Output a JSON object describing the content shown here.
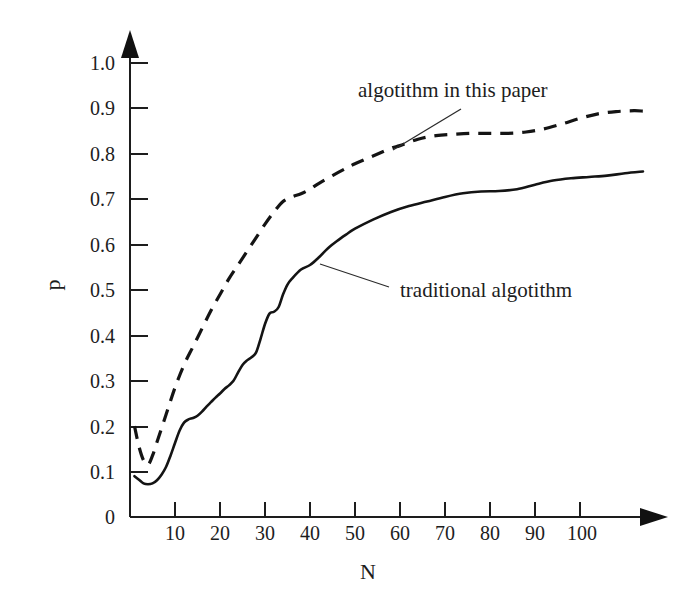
{
  "chart_data": {
    "type": "line",
    "title": "",
    "xlabel": "N",
    "ylabel": "p",
    "xlim": [
      0,
      120
    ],
    "ylim": [
      0,
      1.0
    ],
    "grid": false,
    "legend_position": "inline-annotations",
    "x_ticks": [
      "10",
      "20",
      "30",
      "40",
      "50",
      "60",
      "70",
      "80",
      "90",
      "100"
    ],
    "x_tick_values": [
      10,
      20,
      30,
      40,
      50,
      60,
      70,
      80,
      90,
      100
    ],
    "y_ticks": [
      "0",
      "0.1",
      "0.2",
      "0.3",
      "0.4",
      "0.5",
      "0.6",
      "0.7",
      "0.8",
      "0.9",
      "1.0"
    ],
    "y_tick_values": [
      0,
      0.1,
      0.2,
      0.3,
      0.4,
      0.5,
      0.6,
      0.7,
      0.8,
      0.9,
      1.0
    ],
    "series": [
      {
        "name": "algotithm in this paper",
        "style": "dashed",
        "x": [
          1,
          2,
          3,
          4,
          5,
          6,
          8,
          10,
          12,
          14,
          16,
          18,
          20,
          22,
          24,
          26,
          28,
          30,
          32,
          34,
          36,
          38,
          40,
          42,
          45,
          48,
          50,
          54,
          58,
          60,
          64,
          68,
          72,
          76,
          80,
          84,
          88,
          92,
          96,
          100,
          104,
          108,
          112,
          114
        ],
        "values": [
          0.2,
          0.155,
          0.125,
          0.115,
          0.135,
          0.165,
          0.225,
          0.285,
          0.335,
          0.375,
          0.415,
          0.455,
          0.49,
          0.525,
          0.555,
          0.585,
          0.615,
          0.645,
          0.672,
          0.695,
          0.705,
          0.712,
          0.722,
          0.735,
          0.752,
          0.768,
          0.778,
          0.795,
          0.812,
          0.818,
          0.832,
          0.84,
          0.843,
          0.845,
          0.845,
          0.845,
          0.848,
          0.855,
          0.866,
          0.878,
          0.888,
          0.893,
          0.895,
          0.894
        ]
      },
      {
        "name": "traditional algotithm",
        "style": "solid",
        "x": [
          1,
          2,
          3,
          4,
          5,
          6,
          7,
          8,
          9,
          10,
          11,
          12,
          13,
          14,
          15,
          16,
          17,
          18,
          19,
          20,
          21,
          22,
          23,
          24,
          25,
          26,
          27,
          28,
          29,
          30,
          31,
          32,
          33,
          34,
          35,
          36,
          38,
          40,
          42,
          44,
          46,
          48,
          50,
          54,
          58,
          62,
          66,
          70,
          74,
          78,
          82,
          86,
          90,
          94,
          98,
          102,
          106,
          110,
          114
        ],
        "values": [
          0.09,
          0.082,
          0.074,
          0.072,
          0.074,
          0.081,
          0.093,
          0.11,
          0.135,
          0.163,
          0.19,
          0.208,
          0.215,
          0.218,
          0.223,
          0.232,
          0.243,
          0.253,
          0.263,
          0.272,
          0.282,
          0.29,
          0.3,
          0.318,
          0.335,
          0.345,
          0.352,
          0.362,
          0.392,
          0.425,
          0.448,
          0.452,
          0.462,
          0.49,
          0.512,
          0.525,
          0.545,
          0.555,
          0.572,
          0.592,
          0.608,
          0.622,
          0.635,
          0.655,
          0.672,
          0.685,
          0.695,
          0.705,
          0.713,
          0.717,
          0.718,
          0.722,
          0.732,
          0.741,
          0.746,
          0.749,
          0.752,
          0.757,
          0.761
        ]
      }
    ],
    "annotations": [
      {
        "text": "algotithm in this paper",
        "target_series": "algotithm in this paper",
        "has_leader_line": true
      },
      {
        "text": "traditional algotithm",
        "target_series": "traditional algotithm",
        "has_leader_line": true
      }
    ]
  },
  "axes": {
    "y_axis_label": "p",
    "x_axis_label": "N",
    "y_tick_labels": [
      "1.0",
      "0.9",
      "0.8",
      "0.7",
      "0.6",
      "0.5",
      "0.4",
      "0.3",
      "0.2",
      "0.1",
      "0"
    ],
    "x_tick_labels": [
      "10",
      "20",
      "30",
      "40",
      "50",
      "60",
      "70",
      "80",
      "90",
      "100"
    ]
  },
  "labels": {
    "new_algorithm": "algotithm in this paper",
    "traditional_algorithm": "traditional algotithm"
  },
  "colors": {
    "ink": "#141414",
    "background": "#ffffff"
  }
}
